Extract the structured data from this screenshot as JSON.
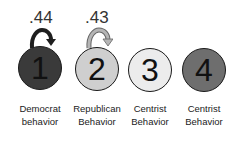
{
  "nodes": [
    {
      "number": "1",
      "label_line1": "Democrat",
      "label_line2": "behavior",
      "fill": "#3a3a3a"
    },
    {
      "number": "2",
      "label_line1": "Republican",
      "label_line2": "Behavior",
      "fill": "#cfcfcf"
    },
    {
      "number": "3",
      "label_line1": "Centrist",
      "label_line2": "Behavior",
      "fill": "#ececec"
    },
    {
      "number": "4",
      "label_line1": "Centrist",
      "label_line2": "Behavior",
      "fill": "#6e6e6e"
    }
  ],
  "self_loops": [
    {
      "node": "1",
      "value": ".44",
      "color": "#1e1e1e"
    },
    {
      "node": "2",
      "value": ".43",
      "color": "#a8a8a8"
    }
  ]
}
